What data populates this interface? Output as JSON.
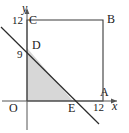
{
  "figure": {
    "axes": {
      "x_label": "x",
      "y_label": "y",
      "origin_label": "O",
      "x_axis_y": 101,
      "y_axis_x": 27,
      "x_ticks": [
        {
          "label": "12",
          "value": 12,
          "px": 103
        }
      ],
      "y_ticks": [
        {
          "label": "12",
          "value": 12,
          "px": 20
        },
        {
          "label": "9",
          "value": 9,
          "px": 48
        }
      ]
    },
    "points": [
      {
        "name": "O",
        "label": "O",
        "x": 0,
        "y": 0,
        "px": 27,
        "py": 101
      },
      {
        "name": "C",
        "label": "C",
        "x": 0,
        "y": 12,
        "px": 27,
        "py": 20
      },
      {
        "name": "B",
        "label": "B",
        "x": 12,
        "y": 12,
        "px": 103,
        "py": 20
      },
      {
        "name": "A",
        "label": "A",
        "x": 12,
        "y": 0,
        "px": 103,
        "py": 101
      },
      {
        "name": "D",
        "label": "D",
        "x": 0,
        "y": 9,
        "px": 27,
        "py": 48
      },
      {
        "name": "E",
        "label": "E",
        "x": 7.5,
        "y": 0,
        "px": 73,
        "py": 101
      }
    ],
    "square": {
      "vertices": [
        "O",
        "A",
        "B",
        "C"
      ],
      "side": 12,
      "stroke": "#3a3a3a"
    },
    "diagonal_line": {
      "from_point": "D",
      "to_point": "E",
      "extends_beyond": true,
      "start_px": {
        "x": 1,
        "y": 27
      },
      "end_px": {
        "x": 99,
        "y": 124
      },
      "stroke": "#2b2b2b"
    },
    "shaded_region": {
      "vertices": [
        "O",
        "D",
        "E"
      ],
      "fill": "#d7d7d7",
      "description": "triangle O-D-E shaded"
    },
    "colors": {
      "axis": "#555555",
      "square_stroke": "#3a3a3a",
      "line_stroke": "#2b2b2b",
      "shade_fill": "#d7d7d7",
      "text": "#1a1a1a",
      "background": "#ffffff"
    }
  }
}
